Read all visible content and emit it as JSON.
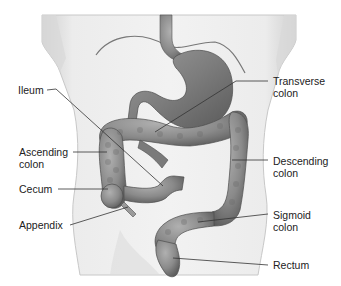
{
  "diagram": {
    "colors": {
      "background": "#ffffff",
      "torso": "#e6e6e6",
      "torso_shadow": "#c9c9c9",
      "organ": "#8a8a8a",
      "organ_dark": "#6e6e6e",
      "organ_light": "#a8a8a8",
      "leader_line": "#333333",
      "text": "#222222"
    },
    "labels": {
      "left": [
        {
          "id": "ileum",
          "lines": [
            "Ileum"
          ]
        },
        {
          "id": "ascending-colon",
          "lines": [
            "Ascending",
            "colon"
          ]
        },
        {
          "id": "cecum",
          "lines": [
            "Cecum"
          ]
        },
        {
          "id": "appendix",
          "lines": [
            "Appendix"
          ]
        }
      ],
      "right": [
        {
          "id": "transverse-colon",
          "lines": [
            "Transverse",
            "colon"
          ]
        },
        {
          "id": "descending-colon",
          "lines": [
            "Descending",
            "colon"
          ]
        },
        {
          "id": "sigmoid-colon",
          "lines": [
            "Sigmoid",
            "colon"
          ]
        },
        {
          "id": "rectum",
          "lines": [
            "Rectum"
          ]
        }
      ]
    }
  }
}
